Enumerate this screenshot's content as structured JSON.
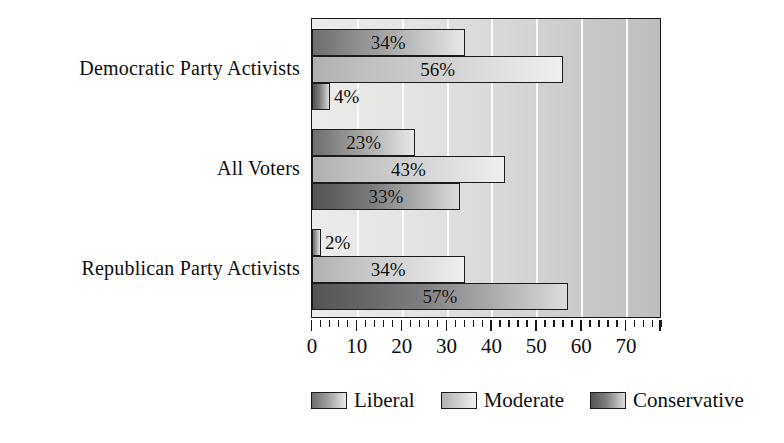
{
  "chart_data": {
    "type": "bar",
    "orientation": "horizontal",
    "title": "",
    "xlabel": "",
    "ylabel": "",
    "xlim": [
      0,
      78
    ],
    "xticks": [
      0,
      10,
      20,
      30,
      40,
      50,
      60,
      70
    ],
    "xtick_labels": [
      "0",
      "10",
      "20",
      "30",
      "40",
      "50",
      "60",
      "70"
    ],
    "grid": true,
    "grid_axis": "x",
    "legend_position": "bottom",
    "categories": [
      "Democratic Party Activists",
      "All Voters",
      "Republican Party Activists"
    ],
    "series": [
      {
        "name": "Liberal",
        "color": "#9d9d9d",
        "values": [
          34,
          23,
          2
        ],
        "labels": [
          "34%",
          "23%",
          "2%"
        ]
      },
      {
        "name": "Moderate",
        "color": "#cfcfcf",
        "values": [
          56,
          43,
          34
        ],
        "labels": [
          "56%",
          "43%",
          "34%"
        ]
      },
      {
        "name": "Conservative",
        "color": "#7e7e7e",
        "values": [
          4,
          33,
          57
        ],
        "labels": [
          "4%",
          "33%",
          "57%"
        ]
      }
    ]
  },
  "legend": {
    "items": [
      {
        "label": "Liberal",
        "swatch": "liberal"
      },
      {
        "label": "Moderate",
        "swatch": "moderate"
      },
      {
        "label": "Conservative",
        "swatch": "conservative"
      }
    ]
  },
  "axis": {
    "tick_labels": [
      "0",
      "10",
      "20",
      "30",
      "40",
      "50",
      "60",
      "70"
    ]
  },
  "category_labels": [
    "Democratic Party Activists",
    "All Voters",
    "Republican Party Activists"
  ]
}
